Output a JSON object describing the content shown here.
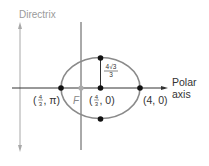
{
  "diagram": {
    "directrix_label": "Directrix",
    "polar_axis_label_line1": "Polar",
    "polar_axis_label_line2": "axis",
    "focus_label": "F",
    "points": [
      {
        "id": "left-vertex",
        "label_num": "4",
        "label_den": "3",
        "label_suffix": ", π)"
      },
      {
        "id": "center",
        "label_num": "4",
        "label_den": "3",
        "label_suffix": ", 0)"
      },
      {
        "id": "right-vertex",
        "label": "(4, 0)"
      }
    ],
    "semi_minor_label_num": "4√3",
    "semi_minor_label_den": "3",
    "colors": {
      "ellipse": "#8a8a8a",
      "axis": "#444444",
      "directrix": "#a0a0a0",
      "point": "#111111",
      "focus": "#aaaaaa"
    }
  }
}
